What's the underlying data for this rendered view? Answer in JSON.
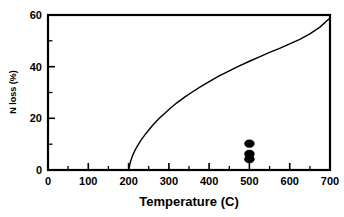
{
  "chart_data": {
    "type": "line",
    "title": "",
    "subtitle": "",
    "xlabel": "Temperature (C)",
    "ylabel": "N loss (%)",
    "xlim": [
      0,
      700
    ],
    "ylim": [
      0,
      60
    ],
    "grid": false,
    "legend": null,
    "legend_position": "none",
    "x_major_ticks": [
      0,
      100,
      200,
      300,
      400,
      500,
      600,
      700
    ],
    "x_major_tick_labels": [
      "0",
      "100",
      "200",
      "300",
      "400",
      "500",
      "600",
      "700"
    ],
    "x_minor_ticks": [
      50,
      150,
      250,
      350,
      450,
      550,
      650
    ],
    "y_major_ticks": [
      0,
      20,
      40,
      60
    ],
    "y_major_tick_labels": [
      "0",
      "20",
      "40",
      "60"
    ],
    "y_minor_ticks": [
      10,
      30,
      50
    ],
    "series": [
      {
        "name": "model curve",
        "type": "line",
        "style": "solid",
        "color": "#000000",
        "x": [
          200,
          205,
          210,
          215,
          220,
          230,
          240,
          250,
          260,
          275,
          290,
          305,
          320,
          340,
          360,
          380,
          400,
          425,
          450,
          475,
          500,
          525,
          550,
          575,
          600,
          625,
          650,
          675,
          700
        ],
        "y": [
          0.0,
          3.4,
          5.6,
          7.3,
          8.8,
          11.4,
          13.5,
          15.5,
          17.3,
          19.8,
          22.0,
          24.1,
          26.0,
          28.3,
          30.4,
          32.4,
          34.2,
          36.4,
          38.4,
          40.3,
          42.1,
          43.8,
          45.5,
          47.1,
          48.8,
          50.6,
          52.7,
          55.3,
          58.8
        ]
      },
      {
        "name": "measured points",
        "type": "scatter",
        "marker": "filled-ellipse",
        "color": "#000000",
        "x": [
          500,
          500,
          500
        ],
        "y": [
          10.2,
          6.2,
          4.2
        ]
      }
    ],
    "annotations": []
  },
  "axes": {
    "x_title": "Temperature (C)",
    "y_title": "N loss (%)"
  }
}
